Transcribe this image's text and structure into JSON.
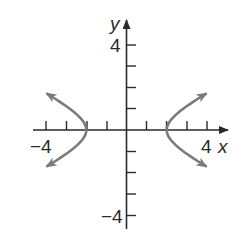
{
  "chart_data": {
    "type": "line",
    "title": "",
    "xlabel": "x",
    "ylabel": "y",
    "xlim": [
      -4,
      4
    ],
    "ylim": [
      -4,
      4
    ],
    "x_tick_labels": [
      "-4",
      "4"
    ],
    "y_tick_labels": [
      "4",
      "-4"
    ],
    "x_ticks": [
      -4,
      -3,
      -2,
      -1,
      1,
      2,
      3,
      4
    ],
    "y_ticks": [
      -4,
      -3,
      -2,
      -1,
      1,
      2,
      3,
      4
    ],
    "grid": false,
    "legend": null,
    "series": [
      {
        "name": "hyperbola left branch",
        "description": "Opens left, vertex at (-2, 0), arrows at both ends",
        "vertex": [
          -2,
          0
        ],
        "points": [
          [
            -3.55,
            1.7
          ],
          [
            -3.0,
            1.12
          ],
          [
            -2.5,
            0.75
          ],
          [
            -2.2,
            0.46
          ],
          [
            -2.0,
            0
          ],
          [
            -2.2,
            -0.46
          ],
          [
            -2.5,
            -0.75
          ],
          [
            -3.0,
            -1.12
          ],
          [
            -3.55,
            -1.7
          ]
        ]
      },
      {
        "name": "hyperbola right branch",
        "description": "Opens right, vertex at (2, 0), arrows at both ends",
        "vertex": [
          2,
          0
        ],
        "points": [
          [
            3.55,
            1.7
          ],
          [
            3.0,
            1.12
          ],
          [
            2.5,
            0.75
          ],
          [
            2.2,
            0.46
          ],
          [
            2.0,
            0
          ],
          [
            2.2,
            -0.46
          ],
          [
            2.5,
            -0.75
          ],
          [
            3.0,
            -1.12
          ],
          [
            3.55,
            -1.7
          ]
        ]
      }
    ],
    "equation_hint": "x^2/4 - y^2 = 1 (approx.)",
    "colors": {
      "axes": "#2a2a2a",
      "curve": "#7a7a7a"
    }
  },
  "labels": {
    "x_axis": "x",
    "y_axis": "y",
    "x_min": "−4",
    "x_max": "4",
    "y_max": "4",
    "y_min": "−4"
  }
}
